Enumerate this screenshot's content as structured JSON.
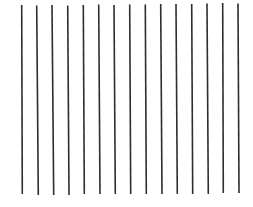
{
  "figure": {
    "background": "#ffffff",
    "line_color": "#2e2e2e",
    "line_width": 1.6,
    "line_count": 15,
    "lines": [
      {
        "x1": 21.7,
        "y1": 5,
        "x2": 22.3,
        "y2": 194
      },
      {
        "x1": 36.7,
        "y1": 5.5,
        "x2": 38.3,
        "y2": 195
      },
      {
        "x1": 52.0,
        "y1": 5,
        "x2": 53.7,
        "y2": 195
      },
      {
        "x1": 67.7,
        "y1": 5.5,
        "x2": 69.0,
        "y2": 195
      },
      {
        "x1": 83.3,
        "y1": 5,
        "x2": 84.3,
        "y2": 194
      },
      {
        "x1": 98.7,
        "y1": 4.5,
        "x2": 100.0,
        "y2": 194
      },
      {
        "x1": 114.0,
        "y1": 5,
        "x2": 115.3,
        "y2": 194
      },
      {
        "x1": 129.7,
        "y1": 4.5,
        "x2": 130.7,
        "y2": 194
      },
      {
        "x1": 145.3,
        "y1": 4.5,
        "x2": 146.3,
        "y2": 194
      },
      {
        "x1": 160.7,
        "y1": 4,
        "x2": 162.0,
        "y2": 194
      },
      {
        "x1": 176.0,
        "y1": 4,
        "x2": 177.3,
        "y2": 194
      },
      {
        "x1": 191.7,
        "y1": 4,
        "x2": 192.7,
        "y2": 194
      },
      {
        "x1": 207.0,
        "y1": 3.5,
        "x2": 208.3,
        "y2": 194
      },
      {
        "x1": 222.7,
        "y1": 3,
        "x2": 223.3,
        "y2": 193
      },
      {
        "x1": 238.0,
        "y1": 3.5,
        "x2": 239.0,
        "y2": 193
      }
    ]
  }
}
